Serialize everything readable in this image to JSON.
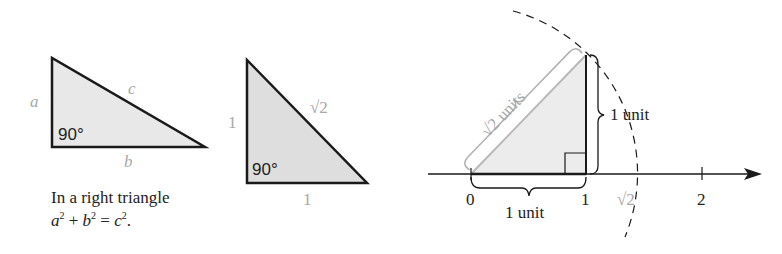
{
  "figure_left": {
    "triangle": {
      "side_a_label": "a",
      "side_b_label": "b",
      "hypotenuse_label": "c",
      "angle_label": "90°"
    },
    "caption": {
      "line1": "In a right triangle",
      "line2_parts": {
        "a": "a",
        "b": "b",
        "c": "c",
        "exp": "2",
        "plus": " + ",
        "equals": " = ",
        "period": "."
      }
    }
  },
  "figure_middle": {
    "triangle": {
      "leg_vertical_label": "1",
      "leg_horizontal_label": "1",
      "hypotenuse_label": "√2",
      "angle_label": "90°"
    }
  },
  "figure_right": {
    "number_line": {
      "tick_labels": [
        "0",
        "1",
        "√2",
        "2"
      ]
    },
    "hypotenuse_brace_label": "√2 units",
    "vertical_brace_label": "1 unit",
    "horizontal_brace_label": "1 unit"
  },
  "colors": {
    "stroke": "#1a1a1a",
    "fill": "#e6e6e6",
    "label_gray": "#a8a8a8"
  }
}
